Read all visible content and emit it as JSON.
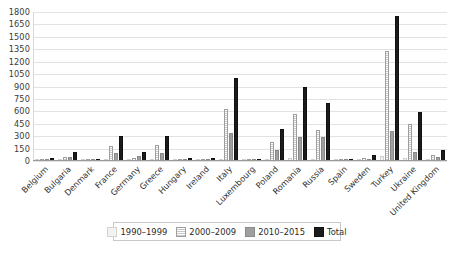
{
  "chart_data": {
    "type": "bar",
    "title": "",
    "xlabel": "",
    "ylabel": "",
    "ylim": [
      0,
      1800
    ],
    "yticks": [
      0,
      150,
      300,
      450,
      600,
      750,
      900,
      1050,
      1200,
      1350,
      1500,
      1650,
      1800
    ],
    "grid": true,
    "legend_position": "bottom",
    "categories": [
      "Belgium",
      "Bulgaria",
      "Denmark",
      "France",
      "Germany",
      "Greece",
      "Hungary",
      "Ireland",
      "Italy",
      "Luxembourg",
      "Poland",
      "Romania",
      "Russia",
      "Spain",
      "Sweden",
      "Turkey",
      "Ukraine",
      "United Kingdom"
    ],
    "series": [
      {
        "name": "1990–1999",
        "color": "#f2f2f2",
        "values": [
          5,
          10,
          5,
          20,
          10,
          15,
          5,
          5,
          30,
          5,
          25,
          40,
          30,
          5,
          10,
          60,
          40,
          10
        ]
      },
      {
        "name": "2000–2009",
        "color": "#fafafa",
        "values": [
          20,
          50,
          10,
          180,
          35,
          190,
          20,
          20,
          630,
          10,
          230,
          570,
          380,
          10,
          35,
          1330,
          450,
          70
        ]
      },
      {
        "name": "2010–2015",
        "color": "#9f9f9f",
        "values": [
          15,
          45,
          10,
          100,
          60,
          95,
          15,
          15,
          340,
          10,
          130,
          290,
          290,
          15,
          25,
          360,
          105,
          50
        ]
      },
      {
        "name": "Total",
        "color": "#1b1b1b",
        "values": [
          40,
          105,
          25,
          300,
          105,
          300,
          40,
          40,
          1000,
          25,
          385,
          900,
          700,
          30,
          70,
          1750,
          595,
          130
        ]
      }
    ]
  },
  "legend": {
    "items": [
      {
        "label": "1990–1999"
      },
      {
        "label": "2000–2009"
      },
      {
        "label": "2010–2015"
      },
      {
        "label": "Total"
      }
    ]
  }
}
